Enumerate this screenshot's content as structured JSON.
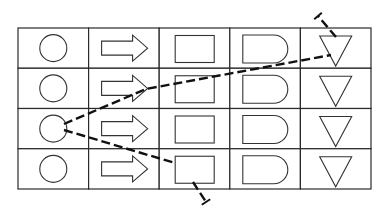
{
  "grid": {
    "rows": 4,
    "columns": 5,
    "x": 18,
    "y": 28,
    "cell_width": 70.6,
    "cell_height": 40.25,
    "border_color": "#2a2a2a"
  },
  "columns": [
    {
      "symbol": "circle-icon"
    },
    {
      "symbol": "right-arrow-icon"
    },
    {
      "symbol": "rectangle-icon"
    },
    {
      "symbol": "delay-d-shape-icon"
    },
    {
      "symbol": "down-triangle-icon"
    }
  ],
  "paths": [
    {
      "name": "upper-path",
      "style": "dashed",
      "color": "#111111",
      "points": [
        [
          64,
          124
        ],
        [
          146,
          89
        ],
        [
          331,
          55
        ]
      ],
      "branch": [
        [
          336,
          37
        ],
        [
          318,
          16
        ]
      ]
    },
    {
      "name": "lower-path",
      "style": "dashed",
      "color": "#111111",
      "points": [
        [
          64,
          130
        ],
        [
          175,
          163
        ]
      ],
      "branch": [
        [
          193,
          182
        ],
        [
          206,
          202
        ]
      ]
    }
  ]
}
